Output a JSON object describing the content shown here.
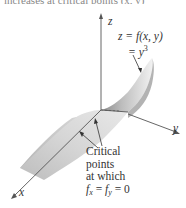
{
  "caption_clipped": "increases at critical points (x, y)",
  "axes": {
    "z": "z",
    "y": "y",
    "x": "x"
  },
  "equation": {
    "line1": "z = f(x, y)",
    "line2_prefix": "= y",
    "line2_exponent": "3"
  },
  "annotation": {
    "line1": "Critical",
    "line2": "points",
    "line3": "at which",
    "line4_f": "f",
    "line4_sub_x": "x",
    "line4_mid": " = ",
    "line4_f2": "f",
    "line4_sub_y": "y",
    "line4_end": " = 0"
  },
  "colors": {
    "surface_light": "#e6e6e6",
    "surface_mid": "#c8c8c8",
    "surface_dark": "#9a9a9a",
    "axis": "#555555"
  }
}
